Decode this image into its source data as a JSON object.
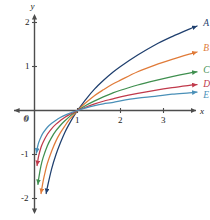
{
  "chart_data": {
    "type": "line",
    "title": "",
    "subtitle": "",
    "xlabel": "x",
    "ylabel": "y",
    "xlim": [
      -0.35,
      3.85
    ],
    "ylim": [
      -2.15,
      2.35
    ],
    "grid": false,
    "legend_position": "right-of-curve-end",
    "xticks": [
      "0",
      "1",
      "2",
      "3"
    ],
    "xtick_values": [
      0,
      1,
      2,
      3
    ],
    "yticks": [
      "2",
      "1",
      "0",
      "-1",
      "-2"
    ],
    "ytick_values": [
      2,
      1,
      0,
      -1,
      -2
    ],
    "axis_color": "#4d4d4d",
    "note": "Five logarithmic curves y = log_b(x), all passing through (1,0); larger base gives flatter curve",
    "series": [
      {
        "name": "A",
        "label": "A",
        "color": "#1f3f6e",
        "base": 2.0,
        "label_x": 3.95,
        "label_y": 1.97,
        "x": [
          0.17,
          0.2,
          0.25,
          0.3,
          0.4,
          0.5,
          0.6,
          0.7,
          0.8,
          0.9,
          1.0,
          1.2,
          1.4,
          1.6,
          1.8,
          2.0,
          2.4,
          2.8,
          3.2,
          3.6,
          3.78
        ],
        "y": [
          -2.56,
          -2.32,
          -2.0,
          -1.74,
          -1.32,
          -1.0,
          -0.74,
          -0.51,
          -0.32,
          -0.15,
          0.0,
          0.26,
          0.49,
          0.68,
          0.85,
          1.0,
          1.26,
          1.49,
          1.68,
          1.85,
          1.92
        ]
      },
      {
        "name": "B",
        "label": "B",
        "color": "#e07b39",
        "base": 2.718,
        "label_x": 3.95,
        "label_y": 1.4,
        "x": [
          0.12,
          0.15,
          0.2,
          0.25,
          0.3,
          0.4,
          0.5,
          0.6,
          0.7,
          0.8,
          0.9,
          1.0,
          1.2,
          1.4,
          1.6,
          1.8,
          2.0,
          2.4,
          2.8,
          3.2,
          3.6,
          3.78
        ],
        "y": [
          -2.12,
          -1.9,
          -1.61,
          -1.39,
          -1.2,
          -0.92,
          -0.69,
          -0.51,
          -0.36,
          -0.22,
          -0.11,
          0.0,
          0.18,
          0.34,
          0.47,
          0.59,
          0.69,
          0.88,
          1.03,
          1.16,
          1.28,
          1.33
        ]
      },
      {
        "name": "C",
        "label": "C",
        "color": "#3f8f4f",
        "base": 4.5,
        "label_x": 3.95,
        "label_y": 0.9,
        "x": [
          0.08,
          0.1,
          0.15,
          0.2,
          0.3,
          0.4,
          0.5,
          0.6,
          0.7,
          0.8,
          0.9,
          1.0,
          1.2,
          1.4,
          1.6,
          1.8,
          2.0,
          2.4,
          2.8,
          3.2,
          3.6,
          3.78
        ],
        "y": [
          -1.68,
          -1.53,
          -1.26,
          -1.07,
          -0.8,
          -0.61,
          -0.46,
          -0.34,
          -0.24,
          -0.15,
          -0.07,
          0.0,
          0.12,
          0.22,
          0.31,
          0.39,
          0.46,
          0.58,
          0.68,
          0.77,
          0.85,
          0.88
        ]
      },
      {
        "name": "D",
        "label": "D",
        "color": "#c0394b",
        "base": 9.5,
        "label_x": 3.95,
        "label_y": 0.59,
        "x": [
          0.06,
          0.08,
          0.1,
          0.15,
          0.2,
          0.3,
          0.4,
          0.5,
          0.6,
          0.7,
          0.8,
          0.9,
          1.0,
          1.2,
          1.4,
          1.6,
          1.8,
          2.0,
          2.4,
          2.8,
          3.2,
          3.6,
          3.78
        ],
        "y": [
          -1.25,
          -1.12,
          -1.02,
          -0.84,
          -0.72,
          -0.54,
          -0.41,
          -0.31,
          -0.23,
          -0.16,
          -0.1,
          -0.05,
          0.0,
          0.08,
          0.15,
          0.21,
          0.26,
          0.31,
          0.39,
          0.46,
          0.52,
          0.57,
          0.59
        ]
      },
      {
        "name": "E",
        "label": "E",
        "color": "#4a90b8",
        "base": 24.0,
        "label_x": 3.95,
        "label_y": 0.32,
        "x": [
          0.045,
          0.06,
          0.08,
          0.1,
          0.15,
          0.2,
          0.3,
          0.4,
          0.5,
          0.6,
          0.7,
          0.8,
          0.9,
          1.0,
          1.2,
          1.4,
          1.6,
          1.8,
          2.0,
          2.4,
          2.8,
          3.2,
          3.6,
          3.78
        ],
        "y": [
          -0.97,
          -0.88,
          -0.79,
          -0.72,
          -0.6,
          -0.51,
          -0.38,
          -0.29,
          -0.22,
          -0.16,
          -0.11,
          -0.07,
          -0.03,
          0.0,
          0.06,
          0.11,
          0.15,
          0.18,
          0.22,
          0.28,
          0.32,
          0.37,
          0.4,
          0.42
        ]
      }
    ]
  },
  "axes": {
    "x_axis_label": "x",
    "y_axis_label": "y"
  }
}
